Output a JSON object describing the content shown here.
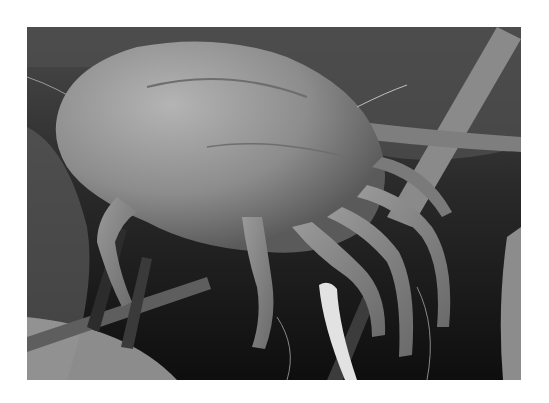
{
  "image": {
    "subject": "Scanning electron micrograph of a dust mite among fibers",
    "alt": "Grayscale SEM image of a dust mite clinging to fibers",
    "colors": {
      "page_background": "#ffffff",
      "background_dark": "#141414",
      "mite_body": "#8a8a8a",
      "mite_highlight": "#b0b0b0",
      "fiber": "#7a7a7a",
      "bright_fiber": "#e0e0e0"
    }
  }
}
